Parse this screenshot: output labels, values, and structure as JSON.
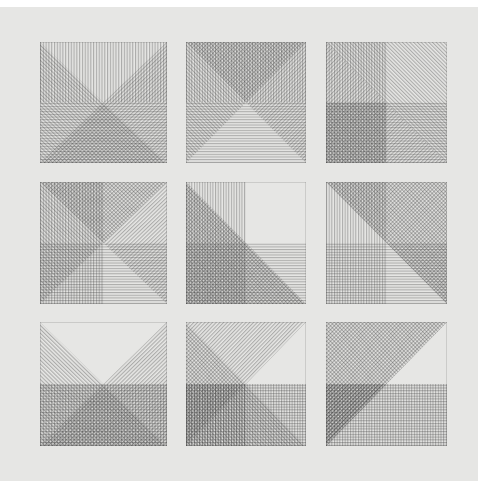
{
  "artwork": {
    "description": "Grid of nine square line-etchings, each composed of hatched triangles and rectangles in four line directions (vertical, horizontal, diagonal left, diagonal right)",
    "paper_color": "#e6e6e4",
    "ink_color": "#3a3a3a",
    "grid": {
      "rows": 3,
      "cols": 3
    },
    "panels": [
      {
        "row": 1,
        "col": 1,
        "x": 40,
        "y": 42,
        "w": 127,
        "h": 121
      },
      {
        "row": 1,
        "col": 2,
        "x": 186,
        "y": 42,
        "w": 120,
        "h": 121
      },
      {
        "row": 1,
        "col": 3,
        "x": 326,
        "y": 42,
        "w": 121,
        "h": 121
      },
      {
        "row": 2,
        "col": 1,
        "x": 40,
        "y": 182,
        "w": 127,
        "h": 122
      },
      {
        "row": 2,
        "col": 2,
        "x": 186,
        "y": 182,
        "w": 120,
        "h": 122
      },
      {
        "row": 2,
        "col": 3,
        "x": 326,
        "y": 182,
        "w": 121,
        "h": 122
      },
      {
        "row": 3,
        "col": 1,
        "x": 40,
        "y": 322,
        "w": 127,
        "h": 124
      },
      {
        "row": 3,
        "col": 2,
        "x": 186,
        "y": 322,
        "w": 120,
        "h": 124
      },
      {
        "row": 3,
        "col": 3,
        "x": 326,
        "y": 322,
        "w": 121,
        "h": 124
      }
    ]
  }
}
